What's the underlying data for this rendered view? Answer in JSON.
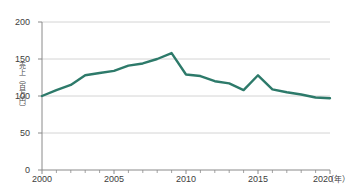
{
  "chart_data": {
    "type": "line",
    "title": "",
    "subtitle": "",
    "xlabel": "年",
    "ylabel": "売上（百万円）",
    "x_unit_label": "（年）",
    "x": [
      2000,
      2001,
      2002,
      2003,
      2004,
      2005,
      2006,
      2007,
      2008,
      2009,
      2010,
      2011,
      2012,
      2013,
      2014,
      2015,
      2016,
      2017,
      2018,
      2019,
      2020
    ],
    "values": [
      100,
      108,
      115,
      128,
      131,
      134,
      141,
      144,
      150,
      158,
      129,
      127,
      120,
      117,
      108,
      128,
      109,
      105,
      102,
      98,
      97
    ],
    "series": [
      {
        "name": "売上",
        "color": "#2d7a6a",
        "values": [
          100,
          108,
          115,
          128,
          131,
          134,
          141,
          144,
          150,
          158,
          129,
          127,
          120,
          117,
          108,
          128,
          109,
          105,
          102,
          98,
          97
        ]
      }
    ],
    "xlim": [
      2000,
      2020
    ],
    "ylim": [
      0,
      200
    ],
    "y_ticks": [
      0,
      50,
      100,
      150,
      200
    ],
    "y_tick_labels": [
      "0",
      "50",
      "100",
      "150",
      "200"
    ],
    "x_ticks": [
      2000,
      2005,
      2010,
      2015,
      2020
    ],
    "x_tick_labels": [
      "2000",
      "2005",
      "2010",
      "2015",
      "2020"
    ],
    "x_minor_tick_interval": 1,
    "grid": true,
    "grid_axis": "y",
    "grid_color": "#c9c9c9",
    "axis_color": "#8a8a8a",
    "legend": false,
    "legend_position": "none",
    "annotations": []
  },
  "axis": {
    "y_title": "売上（百万円）",
    "x_unit": "（年）"
  }
}
